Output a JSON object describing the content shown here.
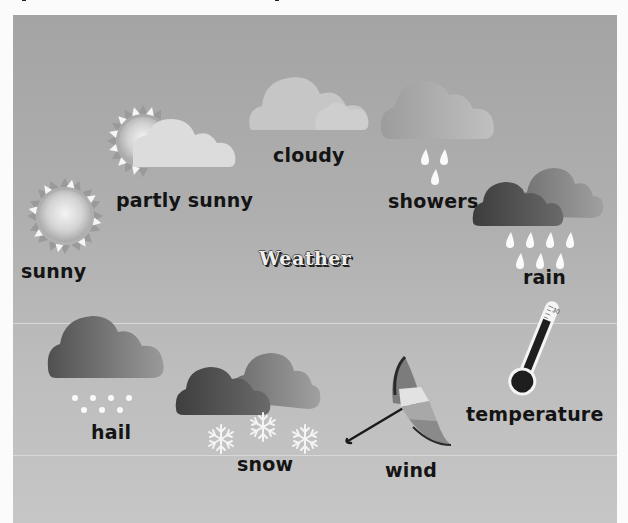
{
  "title": "Weather",
  "items": [
    {
      "id": "sunny",
      "label": "sunny",
      "icon": "sun-icon"
    },
    {
      "id": "partly-sunny",
      "label": "partly sunny",
      "icon": "partly-sunny-icon"
    },
    {
      "id": "cloudy",
      "label": "cloudy",
      "icon": "cloud-icon"
    },
    {
      "id": "showers",
      "label": "showers",
      "icon": "showers-icon"
    },
    {
      "id": "rain",
      "label": "rain",
      "icon": "rain-icon"
    },
    {
      "id": "temperature",
      "label": "temperature",
      "icon": "thermometer-icon"
    },
    {
      "id": "wind",
      "label": "wind",
      "icon": "umbrella-icon"
    },
    {
      "id": "snow",
      "label": "snow",
      "icon": "snow-icon"
    },
    {
      "id": "hail",
      "label": "hail",
      "icon": "hail-icon"
    }
  ],
  "thermometer": {
    "scale_label": "30"
  },
  "colors": {
    "panel": "#adadad",
    "label": "#141414",
    "drop": "#ffffff"
  }
}
